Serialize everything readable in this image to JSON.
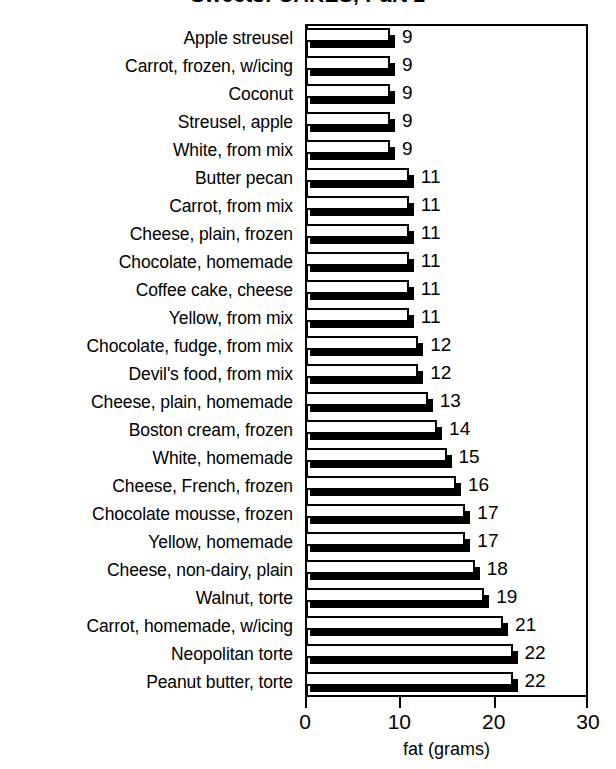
{
  "chart_data": {
    "type": "bar",
    "orientation": "horizontal",
    "title": "Sweets: CAKES, Part 2",
    "xlabel": "fat (grams)",
    "ylabel": "",
    "xlim": [
      0,
      30
    ],
    "xticks": [
      0,
      10,
      20,
      30
    ],
    "grid": false,
    "legend": null,
    "categories": [
      "Apple streusel",
      "Carrot, frozen, w/icing",
      "Coconut",
      "Streusel, apple",
      "White, from mix",
      "Butter pecan",
      "Carrot, from mix",
      "Cheese, plain, frozen",
      "Chocolate, homemade",
      "Coffee cake, cheese",
      "Yellow, from mix",
      "Chocolate, fudge, from mix",
      "Devil's food, from mix",
      "Cheese, plain, homemade",
      "Boston cream, frozen",
      "White, homemade",
      "Cheese, French, frozen",
      "Chocolate mousse, frozen",
      "Yellow, homemade",
      "Cheese, non-dairy, plain",
      "Walnut, torte",
      "Carrot, homemade, w/icing",
      "Neopolitan torte",
      "Peanut butter, torte"
    ],
    "values": [
      9,
      9,
      9,
      9,
      9,
      11,
      11,
      11,
      11,
      11,
      11,
      12,
      12,
      13,
      14,
      15,
      16,
      17,
      17,
      18,
      19,
      21,
      22,
      22
    ],
    "value_labels": [
      "9",
      "9",
      "9",
      "9",
      "9",
      "11",
      "11",
      "11",
      "11",
      "11",
      "11",
      "12",
      "12",
      "13",
      "14",
      "15",
      "16",
      "17",
      "17",
      "18",
      "19",
      "21",
      "22",
      "22"
    ],
    "xtick_labels": [
      "0",
      "10",
      "20",
      "30"
    ]
  },
  "colors": {
    "bar_face": "#ffffff",
    "bar_outline": "#000000",
    "bar_shadow": "#000000",
    "background": "#ffffff",
    "text": "#000000"
  }
}
